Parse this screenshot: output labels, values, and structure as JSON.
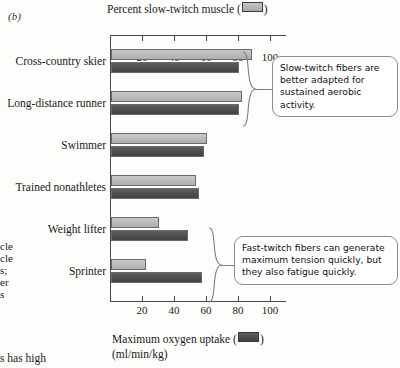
{
  "panel": {
    "label": "(b)"
  },
  "chart_data": {
    "type": "bar",
    "orientation": "horizontal",
    "title": "",
    "categories": [
      "Cross-country skier",
      "Long-distance runner",
      "Swimmer",
      "Trained nonathletes",
      "Weight lifter",
      "Sprinter"
    ],
    "series": [
      {
        "name": "Percent slow-twitch muscle",
        "key": "slow_twitch",
        "color": "#b4b4b4",
        "axis": "top",
        "values": [
          88,
          82,
          60,
          53,
          30,
          22
        ]
      },
      {
        "name": "Maximum oxygen uptake",
        "key": "max_oxygen_uptake",
        "color": "#4d4d4d",
        "axis": "bottom",
        "values": [
          80,
          80,
          58,
          55,
          48,
          57
        ]
      }
    ],
    "top_axis": {
      "label": "Percent slow-twitch muscle",
      "swatch": "light",
      "ticks": [
        20,
        40,
        60,
        80,
        100
      ],
      "range": [
        0,
        110
      ],
      "units": ""
    },
    "bottom_axis": {
      "label": "Maximum oxygen uptake",
      "swatch": "dark",
      "ticks": [
        20,
        40,
        60,
        80,
        100
      ],
      "range": [
        0,
        110
      ],
      "units": "(ml/min/kg)"
    },
    "grid": false,
    "legend_position": "axis-titles",
    "annotations": [
      {
        "id": "aerobic",
        "text": "Slow-twitch fibers are better adapted for sustained aerobic activity.",
        "targets": [
          "Cross-country skier",
          "Long-distance runner"
        ]
      },
      {
        "id": "anaerobic",
        "text": "Fast-twitch fibers can generate maximum tension quickly, but they also fatigue quickly.",
        "targets": [
          "Weight lifter",
          "Sprinter"
        ]
      }
    ]
  },
  "margin_text": {
    "clipped_left_lines": [
      "cle",
      "cle",
      "s;",
      "er",
      "s"
    ],
    "clipped_bottom": "s has high"
  }
}
